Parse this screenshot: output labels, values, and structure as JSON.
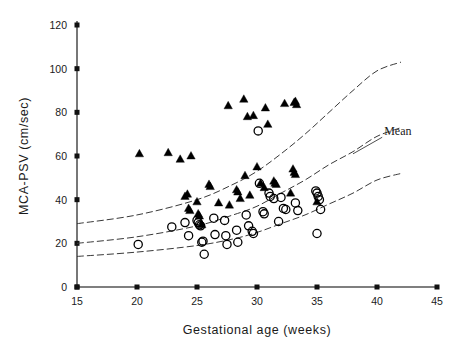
{
  "chart_data": {
    "type": "scatter",
    "title": "",
    "xlabel": "Gestational age (weeks)",
    "ylabel": "MCA-PSV (cm/sec)",
    "xlim": [
      15,
      45
    ],
    "ylim": [
      0,
      120
    ],
    "xticks": [
      15,
      20,
      25,
      30,
      35,
      40,
      45
    ],
    "yticks": [
      0,
      20,
      40,
      60,
      80,
      100,
      120
    ],
    "xtick_labels": [
      "15",
      "20",
      "25",
      "30",
      "35",
      "40",
      "45"
    ],
    "ytick_labels": [
      "0",
      "20",
      "40",
      "60",
      "80",
      "100",
      "120"
    ],
    "grid": false,
    "legend_position": "none",
    "annotations": [
      {
        "text": "Mean",
        "x": 40.6,
        "y": 69.5,
        "leader_from_x": 38.0,
        "leader_from_y": 61.0
      }
    ],
    "series": [
      {
        "name": "filled-triangles",
        "marker": "triangle",
        "filled": true,
        "points": [
          [
            20.2,
            61.0
          ],
          [
            22.6,
            61.5
          ],
          [
            23.6,
            58.5
          ],
          [
            24.5,
            60.0
          ],
          [
            24.0,
            41.5
          ],
          [
            24.2,
            42.5
          ],
          [
            24.3,
            36.0
          ],
          [
            24.4,
            35.0
          ],
          [
            25.0,
            39.0
          ],
          [
            25.1,
            33.5
          ],
          [
            25.2,
            32.5
          ],
          [
            25.4,
            28.5
          ],
          [
            26.0,
            47.0
          ],
          [
            26.1,
            46.0
          ],
          [
            26.8,
            38.5
          ],
          [
            27.6,
            83.0
          ],
          [
            27.7,
            37.5
          ],
          [
            28.3,
            44.5
          ],
          [
            28.4,
            43.5
          ],
          [
            28.6,
            40.5
          ],
          [
            28.9,
            86.0
          ],
          [
            29.0,
            51.0
          ],
          [
            29.2,
            78.0
          ],
          [
            29.4,
            42.0
          ],
          [
            29.7,
            78.5
          ],
          [
            30.0,
            55.0
          ],
          [
            30.3,
            47.5
          ],
          [
            30.6,
            45.5
          ],
          [
            30.7,
            82.0
          ],
          [
            30.9,
            74.5
          ],
          [
            31.4,
            48.5
          ],
          [
            31.5,
            47.5
          ],
          [
            31.6,
            47.0
          ],
          [
            32.3,
            84.0
          ],
          [
            32.8,
            43.0
          ],
          [
            33.1,
            84.5
          ],
          [
            33.2,
            85.0
          ],
          [
            33.3,
            83.5
          ],
          [
            33.0,
            54.0
          ],
          [
            33.1,
            52.5
          ],
          [
            33.2,
            51.5
          ],
          [
            35.0,
            39.0
          ]
        ]
      },
      {
        "name": "open-circles",
        "marker": "circle",
        "filled": false,
        "points": [
          [
            20.1,
            19.5
          ],
          [
            22.9,
            27.5
          ],
          [
            24.0,
            29.5
          ],
          [
            24.3,
            23.5
          ],
          [
            25.0,
            30.5
          ],
          [
            25.1,
            29.5
          ],
          [
            25.2,
            28.5
          ],
          [
            25.3,
            28.0
          ],
          [
            25.4,
            20.5
          ],
          [
            25.5,
            21.0
          ],
          [
            25.6,
            15.0
          ],
          [
            26.4,
            31.5
          ],
          [
            26.5,
            24.0
          ],
          [
            27.3,
            30.5
          ],
          [
            27.4,
            23.5
          ],
          [
            27.5,
            19.5
          ],
          [
            28.3,
            26.0
          ],
          [
            28.4,
            20.5
          ],
          [
            29.1,
            33.0
          ],
          [
            29.3,
            28.0
          ],
          [
            29.6,
            25.5
          ],
          [
            29.7,
            24.5
          ],
          [
            30.1,
            71.5
          ],
          [
            30.2,
            47.5
          ],
          [
            30.5,
            34.5
          ],
          [
            30.6,
            33.5
          ],
          [
            31.0,
            43.0
          ],
          [
            31.1,
            41.5
          ],
          [
            31.4,
            40.5
          ],
          [
            31.8,
            30.0
          ],
          [
            32.0,
            41.0
          ],
          [
            32.2,
            36.0
          ],
          [
            32.4,
            35.5
          ],
          [
            33.2,
            38.5
          ],
          [
            33.4,
            35.0
          ],
          [
            34.9,
            44.0
          ],
          [
            35.0,
            43.0
          ],
          [
            35.1,
            41.5
          ],
          [
            35.2,
            40.0
          ],
          [
            35.3,
            35.5
          ],
          [
            35.0,
            24.5
          ]
        ]
      }
    ],
    "reference_curves": [
      {
        "name": "upper-curve",
        "style": "dashed",
        "points": [
          [
            15,
            29
          ],
          [
            20,
            33
          ],
          [
            25,
            40
          ],
          [
            28,
            47
          ],
          [
            30,
            53
          ],
          [
            32,
            61
          ],
          [
            34,
            70
          ],
          [
            36,
            80
          ],
          [
            38,
            90
          ],
          [
            40,
            99
          ],
          [
            42,
            103
          ]
        ]
      },
      {
        "name": "mean-curve",
        "style": "dashed",
        "label": "Mean",
        "points": [
          [
            15,
            20
          ],
          [
            20,
            23
          ],
          [
            25,
            28
          ],
          [
            28,
            33
          ],
          [
            30,
            37
          ],
          [
            32,
            43
          ],
          [
            34,
            49
          ],
          [
            36,
            56
          ],
          [
            38,
            62
          ],
          [
            40,
            69
          ],
          [
            42,
            73
          ]
        ]
      },
      {
        "name": "lower-curve",
        "style": "dashed",
        "points": [
          [
            15,
            14
          ],
          [
            20,
            16
          ],
          [
            25,
            19
          ],
          [
            28,
            22
          ],
          [
            30,
            25
          ],
          [
            32,
            29
          ],
          [
            34,
            33
          ],
          [
            36,
            38
          ],
          [
            38,
            43
          ],
          [
            40,
            49
          ],
          [
            42,
            52
          ]
        ]
      }
    ]
  }
}
